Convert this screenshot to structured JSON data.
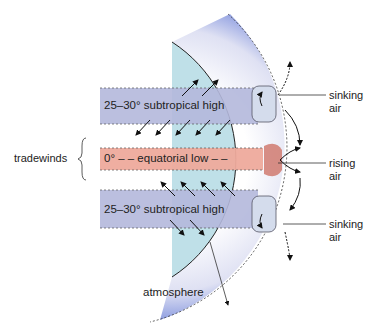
{
  "diagram": {
    "bands": {
      "north_high": "25–30° subtropical high",
      "equator_low": "0° – – equatorial low – –",
      "south_high": "25–30° subtropical high"
    },
    "labels": {
      "tradewinds": "tradewinds",
      "sinking_air_top": [
        "sinking",
        "air"
      ],
      "rising_air": [
        "rising",
        "air"
      ],
      "sinking_air_bottom": [
        "sinking",
        "air"
      ],
      "atmosphere": "atmosphere"
    },
    "colors": {
      "earth": "#bfe0e8",
      "subtropical_band": "#b4b8dc",
      "equatorial_band": "#eeaa9c",
      "atmosphere_edge": "#3a5bc8",
      "rising_cell": "#d07a70"
    }
  }
}
